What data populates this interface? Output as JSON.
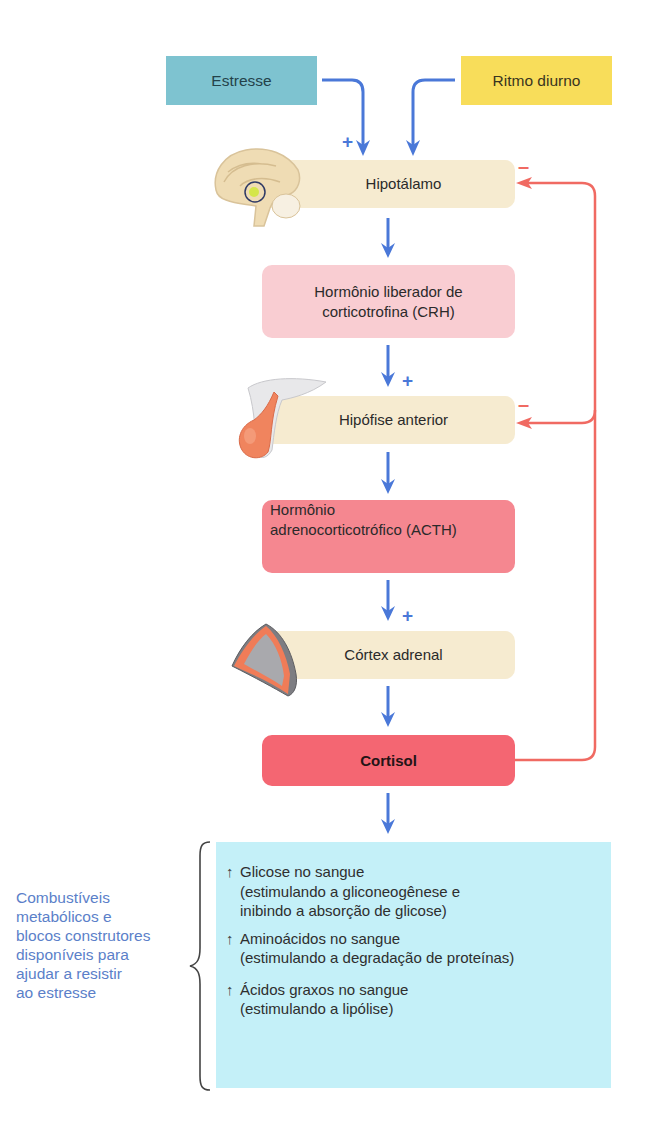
{
  "inputs": {
    "stress": {
      "label": "Estresse",
      "color": "#7ec3d0"
    },
    "diurnal": {
      "label": "Ritmo diurno",
      "color": "#f8dd5a"
    }
  },
  "signs": {
    "plus": "+",
    "minus": "–"
  },
  "nodes": {
    "hypothalamus": {
      "label": "Hipotálamo",
      "color": "#f6ebd0",
      "icon": "brain-icon"
    },
    "crh": {
      "label_line1": "Hormônio liberador de",
      "label_line2": "corticotrofina (CRH)",
      "color": "#f9cdd2"
    },
    "pituitary": {
      "label": "Hipófise anterior",
      "color": "#f6ebd0",
      "icon": "pituitary-gland-icon"
    },
    "acth": {
      "label_line1": "Hormônio",
      "label_line2": "adrenocorticotrófico (ACTH)",
      "color": "#f58790"
    },
    "adrenal": {
      "label": "Córtex adrenal",
      "color": "#f6ebd0",
      "icon": "adrenal-gland-icon"
    },
    "cortisol": {
      "label": "Cortisol",
      "color": "#f46672"
    }
  },
  "colors": {
    "stimulatory_arrow": "#4a78d8",
    "inhibitory_feedback": "#f06a62",
    "effects_bg": "#c4f0f8",
    "caption_text": "#5b7fc9"
  },
  "effects": {
    "caption": [
      "Combustíveis",
      "metabólicos e",
      "blocos construtores",
      "disponíveis para",
      "ajudar a resistir",
      "ao estresse"
    ],
    "items": [
      {
        "arrow": "↑",
        "title": "Glicose no sangue",
        "detail_line1": "(estimulando a gliconeogênese e",
        "detail_line2": "inibindo a absorção de glicose)"
      },
      {
        "arrow": "↑",
        "title": "Aminoácidos no sangue",
        "detail_line1": "(estimulando a degradação de proteínas)"
      },
      {
        "arrow": "↑",
        "title": "Ácidos graxos no sangue",
        "detail_line1": "(estimulando a lipólise)"
      }
    ]
  }
}
